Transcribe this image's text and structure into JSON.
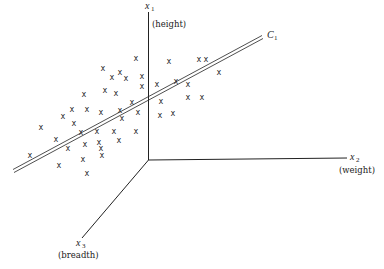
{
  "diagram": {
    "axes": [
      {
        "id": "x1",
        "symbol": "x",
        "subscript": "1",
        "label": "(height)"
      },
      {
        "id": "x2",
        "symbol": "x",
        "subscript": "2",
        "label": "(weight)"
      },
      {
        "id": "x3",
        "symbol": "x",
        "subscript": "3",
        "label": "(breadth)"
      }
    ],
    "line": {
      "symbol": "C",
      "subscript": "1"
    },
    "point_marker": "x",
    "points": [
      [
        136,
        58
      ],
      [
        169,
        61
      ],
      [
        206,
        59
      ],
      [
        103,
        68
      ],
      [
        120,
        72
      ],
      [
        142,
        76
      ],
      [
        219,
        72
      ],
      [
        112,
        77
      ],
      [
        126,
        78
      ],
      [
        157,
        84
      ],
      [
        176,
        81
      ],
      [
        188,
        84
      ],
      [
        142,
        86
      ],
      [
        105,
        90
      ],
      [
        116,
        93
      ],
      [
        84,
        94
      ],
      [
        161,
        101
      ],
      [
        188,
        97
      ],
      [
        202,
        97
      ],
      [
        132,
        102
      ],
      [
        72,
        109
      ],
      [
        87,
        109
      ],
      [
        101,
        112
      ],
      [
        120,
        110
      ],
      [
        138,
        112
      ],
      [
        63,
        116
      ],
      [
        74,
        123
      ],
      [
        122,
        118
      ],
      [
        160,
        115
      ],
      [
        173,
        113
      ],
      [
        41,
        127
      ],
      [
        81,
        132
      ],
      [
        97,
        131
      ],
      [
        114,
        131
      ],
      [
        136,
        131
      ],
      [
        119,
        140
      ],
      [
        56,
        139
      ],
      [
        68,
        148
      ],
      [
        85,
        144
      ],
      [
        99,
        142
      ],
      [
        30,
        155
      ],
      [
        102,
        155
      ],
      [
        83,
        159
      ],
      [
        59,
        165
      ],
      [
        87,
        173
      ],
      [
        199,
        59
      ],
      [
        101,
        148
      ]
    ]
  }
}
